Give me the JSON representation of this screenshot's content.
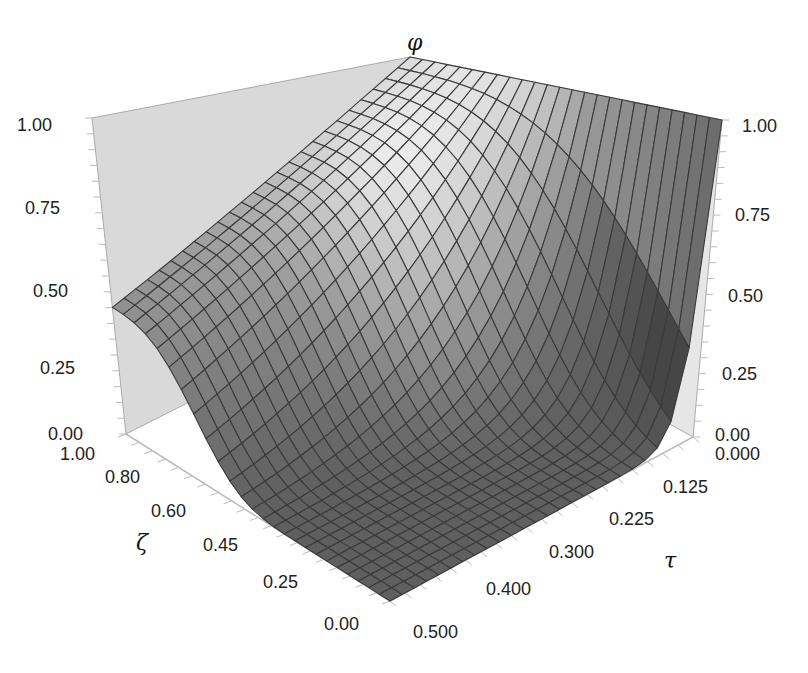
{
  "chart_data": {
    "type": "surface",
    "title": "",
    "zlabel": "φ",
    "xlabel": "ζ",
    "ylabel": "τ",
    "z_ticks": [
      "0.00",
      "0.25",
      "0.50",
      "0.75",
      "1.00"
    ],
    "x_ticks": [
      "0.00",
      "0.25",
      "0.45",
      "0.60",
      "0.80",
      "1.00"
    ],
    "y_ticks": [
      "0.000",
      "0.125",
      "0.225",
      "0.300",
      "0.400",
      "0.500"
    ],
    "zlim": [
      0,
      1
    ],
    "xlim": [
      0,
      1
    ],
    "ylim": [
      0,
      0.5
    ],
    "grid": true,
    "mesh_lines": 25,
    "colormap": "grayscale",
    "surface_samples": {
      "description": "phi(zeta, tau) approximate values read from the surface",
      "points": [
        {
          "zeta": 1.0,
          "tau": 0.0,
          "phi": 1.0
        },
        {
          "zeta": 1.0,
          "tau": 0.5,
          "phi": 0.4
        },
        {
          "zeta": 0.0,
          "tau": 0.0,
          "phi": 1.0
        },
        {
          "zeta": 0.0,
          "tau": 0.5,
          "phi": 0.0
        },
        {
          "zeta": 0.5,
          "tau": 0.25,
          "phi": 0.3
        }
      ]
    }
  },
  "labels": {
    "z_left": [
      "1.00",
      "0.75",
      "0.50",
      "0.25",
      "0.00"
    ],
    "z_right": [
      "1.00",
      "0.75",
      "0.50",
      "0.25",
      "0.00"
    ],
    "zeta_axis": [
      "1.00",
      "0.80",
      "0.60",
      "0.45",
      "0.25",
      "0.00"
    ],
    "tau_axis": [
      "0.000",
      "0.125",
      "0.225",
      "0.300",
      "0.400",
      "0.500"
    ],
    "phi_title": "φ",
    "zeta_title": "ζ",
    "tau_title": "τ"
  },
  "colors": {
    "wall": "#d9d9d9",
    "mesh": "#3a3a3a",
    "axis": "#bbbbbb"
  }
}
